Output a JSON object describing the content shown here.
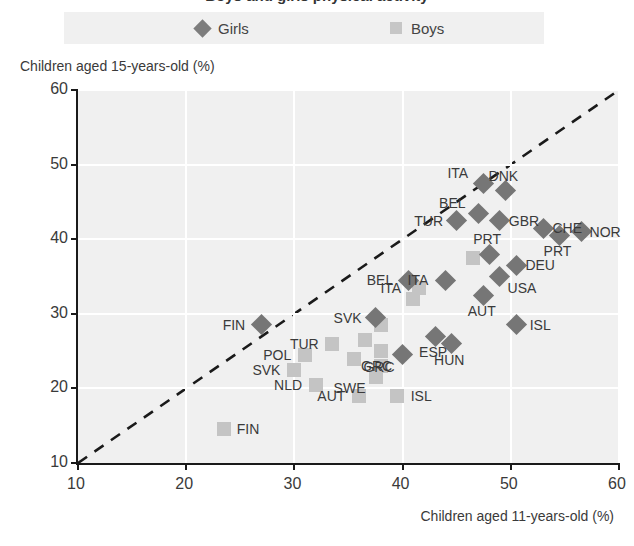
{
  "title_clipped": "Boys and girls physical activity",
  "legend": {
    "girls": {
      "label": "Girls",
      "marker": "diamond-marker",
      "color": "#767676"
    },
    "boys": {
      "label": "Boys",
      "marker": "square-marker",
      "color": "#c4c4c4"
    }
  },
  "axes": {
    "ytitle": "Children aged 15-years-old (%)",
    "xtitle": "Children aged 11-years-old (%)",
    "yticks": [
      "60",
      "50",
      "40",
      "30",
      "20",
      "10"
    ],
    "xticks": [
      "10",
      "20",
      "30",
      "40",
      "50",
      "60"
    ]
  },
  "chart_data": {
    "type": "scatter",
    "title": "Boys and girls physical activity",
    "xlabel": "Children aged 11-years-old (%)",
    "ylabel": "Children aged 15-years-old (%)",
    "xlim": [
      10,
      60
    ],
    "ylim": [
      10,
      60
    ],
    "xticks": [
      10,
      20,
      30,
      40,
      50,
      60
    ],
    "yticks": [
      10,
      20,
      30,
      40,
      50,
      60
    ],
    "grid": true,
    "legend_position": "top",
    "reference_line": {
      "type": "identity",
      "style": "dashed",
      "from": [
        10,
        10
      ],
      "to": [
        60,
        60
      ]
    },
    "series": [
      {
        "name": "Girls",
        "marker": "diamond",
        "color": "#767676",
        "points": [
          {
            "label": "FIN",
            "x": 27.0,
            "y": 28.5,
            "label_pos": "left"
          },
          {
            "label": "SVK",
            "x": 37.5,
            "y": 29.5,
            "label_pos": "left"
          },
          {
            "label": "BEL",
            "x": 40.5,
            "y": 34.5,
            "label_pos": "left"
          },
          {
            "label": "GRC",
            "x": 40.0,
            "y": 24.5,
            "label_pos": "below-left"
          },
          {
            "label": "ESP",
            "x": 43.0,
            "y": 27.0,
            "label_pos": "below"
          },
          {
            "label": "HUN",
            "x": 44.5,
            "y": 26.0,
            "label_pos": "below"
          },
          {
            "label": "ITA",
            "x": 44.0,
            "y": 34.5,
            "label_pos": "left"
          },
          {
            "label": "TUR",
            "x": 45.0,
            "y": 42.5,
            "label_pos": "left"
          },
          {
            "label": "BEL",
            "x": 47.0,
            "y": 43.5,
            "label_pos": "above-left"
          },
          {
            "label": "ITA",
            "x": 47.5,
            "y": 47.5,
            "label_pos": "above-left"
          },
          {
            "label": "DNK",
            "x": 49.5,
            "y": 46.5,
            "label_pos": "above"
          },
          {
            "label": "GBR",
            "x": 49.0,
            "y": 42.5,
            "label_pos": "right"
          },
          {
            "label": "AUT",
            "x": 47.5,
            "y": 32.5,
            "label_pos": "below"
          },
          {
            "label": "USA",
            "x": 49.0,
            "y": 35.0,
            "label_pos": "below-right"
          },
          {
            "label": "PRT",
            "x": 48.0,
            "y": 38.0,
            "label_pos": "above"
          },
          {
            "label": "DEU",
            "x": 50.5,
            "y": 36.5,
            "label_pos": "right"
          },
          {
            "label": "ISL",
            "x": 50.5,
            "y": 28.5,
            "label_pos": "right"
          },
          {
            "label": "CHE",
            "x": 53.0,
            "y": 41.5,
            "label_pos": "right"
          },
          {
            "label": "PRT",
            "x": 54.5,
            "y": 40.5,
            "label_pos": "below"
          },
          {
            "label": "NOR",
            "x": 56.5,
            "y": 41.0,
            "label_pos": "right"
          }
        ]
      },
      {
        "name": "Boys",
        "marker": "square",
        "color": "#c4c4c4",
        "points": [
          {
            "label": "FIN",
            "x": 23.5,
            "y": 14.5,
            "label_pos": "right"
          },
          {
            "label": "SVK",
            "x": 30.0,
            "y": 22.5,
            "label_pos": "left"
          },
          {
            "label": "POL",
            "x": 31.0,
            "y": 24.5,
            "label_pos": "left"
          },
          {
            "label": "NLD",
            "x": 32.0,
            "y": 20.5,
            "label_pos": "left"
          },
          {
            "label": "TUR",
            "x": 33.5,
            "y": 26.0,
            "label_pos": "left"
          },
          {
            "label": "AUT",
            "x": 36.0,
            "y": 19.0,
            "label_pos": "left"
          },
          {
            "label": "SWE",
            "x": 37.5,
            "y": 21.5,
            "label_pos": "below-left"
          },
          {
            "label": "ISL",
            "x": 39.5,
            "y": 19.0,
            "label_pos": "right"
          },
          {
            "label": "GRC",
            "x": 38.0,
            "y": 25.0,
            "label_pos": "below"
          },
          {
            "label": "BEL",
            "x": 38.0,
            "y": 28.5,
            "label_pos": "none"
          },
          {
            "label": "ITA",
            "x": 41.5,
            "y": 33.5,
            "label_pos": "left"
          },
          {
            "label": "PRT",
            "x": 46.5,
            "y": 37.5,
            "label_pos": "none"
          },
          {
            "label": "USA",
            "x": 41.0,
            "y": 32.0,
            "label_pos": "none"
          },
          {
            "label": "OTH",
            "x": 35.5,
            "y": 24.0,
            "label_pos": "none"
          },
          {
            "label": "OTH2",
            "x": 36.5,
            "y": 26.5,
            "label_pos": "none"
          },
          {
            "label": "OTH3",
            "x": 38.0,
            "y": 23.0,
            "label_pos": "none"
          }
        ]
      }
    ]
  }
}
